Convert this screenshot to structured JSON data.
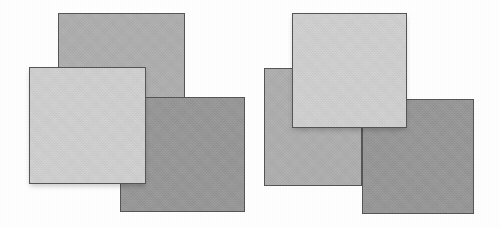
{
  "figure": {
    "canvas": {
      "width": 500,
      "height": 228,
      "background": "#ffffff"
    },
    "border_color": "#555555",
    "shadow_color": "rgba(0,0,0,0.22)"
  },
  "palette": {
    "light_grey": "#d0d0d0",
    "medium_grey": "#aeaeae",
    "dark_grey": "#969696",
    "outline": "#555555",
    "background": "#ffffff"
  },
  "groups": [
    {
      "id": "left-group",
      "label": "Left arrangement",
      "squares": [
        {
          "id": "left-medium-square",
          "label": "Medium grey square (upper)",
          "tone": "medium",
          "color": "#aeaeae",
          "x": 58,
          "y": 13,
          "width": 127,
          "height": 85,
          "z": 10,
          "shadow": false
        },
        {
          "id": "left-dark-square",
          "label": "Dark grey square (lower right)",
          "tone": "dark",
          "color": "#969696",
          "x": 120,
          "y": 97,
          "width": 125,
          "height": 115,
          "z": 20,
          "shadow": false
        },
        {
          "id": "left-light-square",
          "label": "Light grey square (front, left)",
          "tone": "light",
          "color": "#d0d0d0",
          "x": 29,
          "y": 67,
          "width": 117,
          "height": 117,
          "z": 30,
          "shadow": true
        }
      ]
    },
    {
      "id": "right-group",
      "label": "Right arrangement",
      "squares": [
        {
          "id": "right-medium-square",
          "label": "Medium grey square (lower left)",
          "tone": "medium",
          "color": "#aeaeae",
          "x": 264,
          "y": 68,
          "width": 98,
          "height": 118,
          "z": 10,
          "shadow": false
        },
        {
          "id": "right-dark-square",
          "label": "Dark grey square (lower right)",
          "tone": "dark",
          "color": "#969696",
          "x": 362,
          "y": 99,
          "width": 112,
          "height": 115,
          "z": 20,
          "shadow": false
        },
        {
          "id": "right-light-square",
          "label": "Light grey square (front, upper)",
          "tone": "light",
          "color": "#d0d0d0",
          "x": 292,
          "y": 13,
          "width": 115,
          "height": 115,
          "z": 30,
          "shadow": true
        }
      ]
    }
  ]
}
